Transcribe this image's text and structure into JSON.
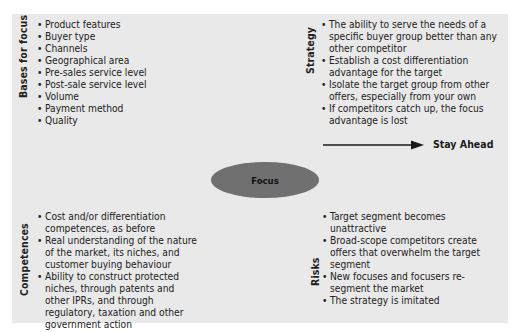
{
  "diagram": {
    "center": {
      "label": "Focus",
      "color": "#707070"
    },
    "quadrants": {
      "bases": {
        "title": "Bases for focus",
        "items": [
          "Product features",
          "Buyer type",
          "Channels",
          "Geographical area",
          "Pre-sales service level",
          "Post-sale service level",
          "Volume",
          "Payment method",
          "Quality"
        ]
      },
      "strategy": {
        "title": "Strategy",
        "items": [
          "The ability to  serve the needs of a specific buyer group better than any other competitor",
          "Establish a cost differentiation advantage for the target",
          "Isolate the target group from other offers, especially from your own",
          "If competitors catch up,  the focus advantage is lost"
        ],
        "arrow_label": "Stay Ahead"
      },
      "competences": {
        "title": "Competences",
        "items": [
          "Cost and/or differentiation competences, as before",
          "Real understanding of the nature of the market, its niches, and customer buying behaviour",
          "Ability to construct protected niches, through patents and other IPRs, and through regulatory, taxation and other government action"
        ]
      },
      "risks": {
        "title": "Risks",
        "items": [
          "Target segment becomes unattractive",
          "Broad-scope competitors create offers that overwhelm the target segment",
          "New focuses and focusers re-segment the market",
          "The strategy is imitated"
        ]
      }
    },
    "colors": {
      "panel": "#e9e9e9",
      "ellipse": "#707070",
      "text": "#1f1f1f"
    }
  }
}
